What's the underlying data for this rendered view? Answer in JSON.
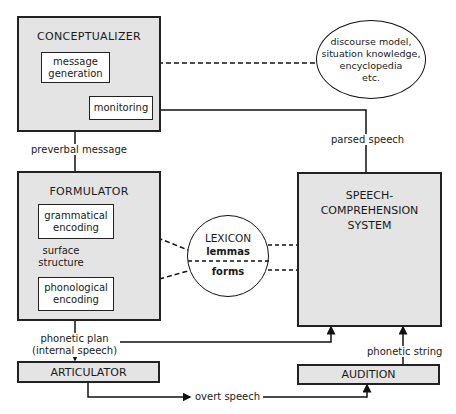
{
  "conceptualizer": {
    "title": "CONCEPTUALIZER",
    "message_generation": [
      "message",
      "generation"
    ],
    "monitoring": "monitoring"
  },
  "knowledge": {
    "lines": [
      "discourse model,",
      "situation knowledge,",
      "encyclopedia",
      "etc."
    ]
  },
  "formulator": {
    "title": "FORMULATOR",
    "grammatical_encoding": [
      "grammatical",
      "encoding"
    ],
    "phonological_encoding": [
      "phonological",
      "encoding"
    ],
    "surface_structure": [
      "surface",
      "structure"
    ]
  },
  "lexicon": {
    "title": "LEXICON",
    "lemmas": "lemmas",
    "forms": "forms"
  },
  "comprehension": {
    "title_lines": [
      "SPEECH-",
      "COMPREHENSION",
      "SYSTEM"
    ]
  },
  "articulator": {
    "title": "ARTICULATOR"
  },
  "audition": {
    "title": "AUDITION"
  },
  "labels": {
    "preverbal_message": "preverbal message",
    "parsed_speech": "parsed speech",
    "phonetic_plan": [
      "phonetic plan",
      "(internal speech)"
    ],
    "phonetic_string": "phonetic string",
    "overt_speech": "overt speech"
  }
}
